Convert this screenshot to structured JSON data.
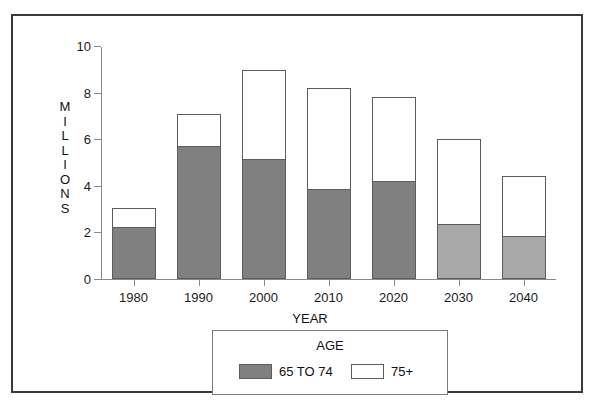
{
  "chart_data": {
    "type": "bar",
    "title": "",
    "subtitle": "",
    "stacked": true,
    "xlabel": "YEAR",
    "ylabel": "MILLIONS",
    "categories": [
      "1980",
      "1990",
      "2000",
      "2010",
      "2020",
      "2030",
      "2040"
    ],
    "series": [
      {
        "name": "65 TO 74",
        "color": "#808080",
        "values": [
          2.2,
          5.65,
          5.1,
          3.8,
          4.15,
          2.3,
          1.8
        ]
      },
      {
        "name": "75+",
        "color": "#ffffff",
        "values": [
          0.85,
          1.45,
          3.85,
          4.4,
          3.65,
          3.7,
          2.6
        ]
      }
    ],
    "totals": [
      3.05,
      7.1,
      8.95,
      8.2,
      7.8,
      6.0,
      4.4
    ],
    "ylim": [
      0,
      10
    ],
    "ytick_values": [
      0,
      2,
      4,
      6,
      8,
      10
    ],
    "ytick_labels": [
      "0",
      "2",
      "4",
      "6",
      "8",
      "10"
    ],
    "grid": false,
    "legend_position": "bottom-center",
    "legend_title": "AGE"
  },
  "axis": {
    "y_letters": [
      "M",
      "I",
      "L",
      "L",
      "I",
      "O",
      "N",
      "S"
    ],
    "x_title": "YEAR"
  },
  "legend": {
    "title": "AGE",
    "entries": [
      {
        "label": "65 TO 74",
        "swatch": "#808080"
      },
      {
        "label": "75+",
        "swatch": "#ffffff"
      }
    ]
  },
  "colors": {
    "bar_gray_dark": "#808080",
    "bar_gray_light": "#a9a9a9",
    "bar_outline": "#5d5d5d",
    "axis": "#8a8a8a",
    "frame": "#3a3a3a",
    "text": "#111111"
  }
}
